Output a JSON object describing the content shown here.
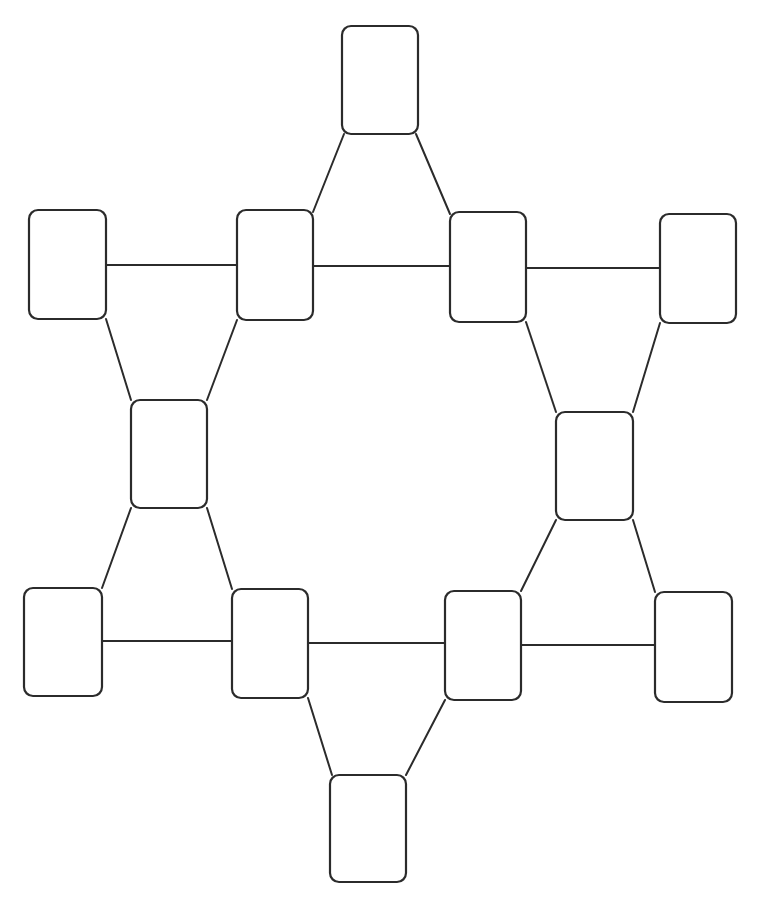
{
  "page": {
    "background_color": "#ffffff",
    "width": 757,
    "height": 916
  },
  "style": {
    "node_fill": "#ffffff",
    "node_stroke": "#2b2b2b",
    "node_stroke_width": 2.2,
    "node_corner_radius": 9,
    "edge_stroke": "#2b2b2b",
    "edge_stroke_width": 2
  },
  "diagram": {
    "type": "node-link-diagram",
    "shape": "hexagonal-ring",
    "node_count": 13,
    "edge_count": 16,
    "all_nodes_blank": true,
    "nodes": [
      {
        "id": "n-top",
        "label": "",
        "x": 342,
        "y": 26,
        "w": 76,
        "h": 108,
        "rx": 9
      },
      {
        "id": "n-row1-far-left",
        "label": "",
        "x": 29,
        "y": 210,
        "w": 77,
        "h": 109,
        "rx": 9
      },
      {
        "id": "n-row1-left",
        "label": "",
        "x": 237,
        "y": 210,
        "w": 76,
        "h": 110,
        "rx": 9
      },
      {
        "id": "n-row1-right",
        "label": "",
        "x": 450,
        "y": 212,
        "w": 76,
        "h": 110,
        "rx": 9
      },
      {
        "id": "n-row1-far-right",
        "label": "",
        "x": 660,
        "y": 214,
        "w": 76,
        "h": 109,
        "rx": 9
      },
      {
        "id": "n-mid-left",
        "label": "",
        "x": 131,
        "y": 400,
        "w": 76,
        "h": 108,
        "rx": 9
      },
      {
        "id": "n-mid-right",
        "label": "",
        "x": 556,
        "y": 412,
        "w": 77,
        "h": 108,
        "rx": 9
      },
      {
        "id": "n-row3-far-left",
        "label": "",
        "x": 24,
        "y": 588,
        "w": 78,
        "h": 108,
        "rx": 9
      },
      {
        "id": "n-row3-left",
        "label": "",
        "x": 232,
        "y": 589,
        "w": 76,
        "h": 109,
        "rx": 9
      },
      {
        "id": "n-row3-right",
        "label": "",
        "x": 445,
        "y": 591,
        "w": 76,
        "h": 109,
        "rx": 9
      },
      {
        "id": "n-row3-far-right",
        "label": "",
        "x": 655,
        "y": 592,
        "w": 77,
        "h": 110,
        "rx": 9
      },
      {
        "id": "n-bottom",
        "label": "",
        "x": 330,
        "y": 775,
        "w": 76,
        "h": 107,
        "rx": 9
      },
      {
        "id": "n-center-empty",
        "label": "",
        "x": 0,
        "y": 0,
        "w": 0,
        "h": 0,
        "rx": 0
      }
    ],
    "edges": [
      {
        "id": "e-top-to-row1-left",
        "from": "n-top",
        "to": "n-row1-left",
        "kind": "diagonal",
        "x1": 344,
        "y1": 134,
        "x2": 313,
        "y2": 212
      },
      {
        "id": "e-top-to-row1-right",
        "from": "n-top",
        "to": "n-row1-right",
        "kind": "diagonal",
        "x1": 416,
        "y1": 134,
        "x2": 450,
        "y2": 214
      },
      {
        "id": "e-row1-farleft-to-left",
        "from": "n-row1-far-left",
        "to": "n-row1-left",
        "kind": "horizontal",
        "x1": 106,
        "y1": 265,
        "x2": 237,
        "y2": 265
      },
      {
        "id": "e-row1-left-to-right",
        "from": "n-row1-left",
        "to": "n-row1-right",
        "kind": "horizontal",
        "x1": 313,
        "y1": 266,
        "x2": 450,
        "y2": 266
      },
      {
        "id": "e-row1-right-to-farright",
        "from": "n-row1-right",
        "to": "n-row1-far-right",
        "kind": "horizontal",
        "x1": 526,
        "y1": 268,
        "x2": 660,
        "y2": 268
      },
      {
        "id": "e-row1-farleft-to-midleft",
        "from": "n-row1-far-left",
        "to": "n-mid-left",
        "kind": "diagonal",
        "x1": 106,
        "y1": 319,
        "x2": 131,
        "y2": 400
      },
      {
        "id": "e-row1-left-to-midleft",
        "from": "n-row1-left",
        "to": "n-mid-left",
        "kind": "diagonal",
        "x1": 237,
        "y1": 320,
        "x2": 207,
        "y2": 400
      },
      {
        "id": "e-row1-right-to-midright",
        "from": "n-row1-right",
        "to": "n-mid-right",
        "kind": "diagonal",
        "x1": 526,
        "y1": 322,
        "x2": 556,
        "y2": 412
      },
      {
        "id": "e-row1-farright-to-midright",
        "from": "n-row1-far-right",
        "to": "n-mid-right",
        "kind": "diagonal",
        "x1": 660,
        "y1": 323,
        "x2": 633,
        "y2": 412
      },
      {
        "id": "e-midleft-to-row3-farleft",
        "from": "n-mid-left",
        "to": "n-row3-far-left",
        "kind": "diagonal",
        "x1": 131,
        "y1": 508,
        "x2": 102,
        "y2": 588
      },
      {
        "id": "e-midleft-to-row3-left",
        "from": "n-mid-left",
        "to": "n-row3-left",
        "kind": "diagonal",
        "x1": 207,
        "y1": 508,
        "x2": 232,
        "y2": 589
      },
      {
        "id": "e-midright-to-row3-right",
        "from": "n-mid-right",
        "to": "n-row3-right",
        "kind": "diagonal",
        "x1": 556,
        "y1": 520,
        "x2": 521,
        "y2": 591
      },
      {
        "id": "e-midright-to-row3-farright",
        "from": "n-mid-right",
        "to": "n-row3-far-right",
        "kind": "diagonal",
        "x1": 633,
        "y1": 520,
        "x2": 655,
        "y2": 592
      },
      {
        "id": "e-row3-farleft-to-left",
        "from": "n-row3-far-left",
        "to": "n-row3-left",
        "kind": "horizontal",
        "x1": 102,
        "y1": 641,
        "x2": 232,
        "y2": 641
      },
      {
        "id": "e-row3-left-to-right",
        "from": "n-row3-left",
        "to": "n-row3-right",
        "kind": "horizontal",
        "x1": 308,
        "y1": 643,
        "x2": 445,
        "y2": 643
      },
      {
        "id": "e-row3-right-to-farright",
        "from": "n-row3-right",
        "to": "n-row3-far-right",
        "kind": "horizontal",
        "x1": 521,
        "y1": 645,
        "x2": 655,
        "y2": 645
      },
      {
        "id": "e-row3-left-to-bottom",
        "from": "n-row3-left",
        "to": "n-bottom",
        "kind": "diagonal",
        "x1": 308,
        "y1": 698,
        "x2": 332,
        "y2": 775
      },
      {
        "id": "e-row3-right-to-bottom",
        "from": "n-row3-right",
        "to": "n-bottom",
        "kind": "diagonal",
        "x1": 445,
        "y1": 700,
        "x2": 406,
        "y2": 775
      }
    ]
  }
}
